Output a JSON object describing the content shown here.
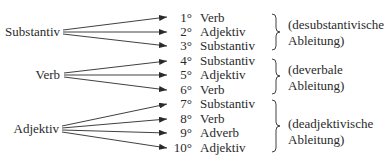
{
  "diagram": {
    "sources": [
      {
        "label": "Substantiv"
      },
      {
        "label": "Verb"
      },
      {
        "label": "Adjektiv"
      }
    ],
    "targets": [
      {
        "num": "1°",
        "label": "Verb"
      },
      {
        "num": "2°",
        "label": "Adjektiv"
      },
      {
        "num": "3°",
        "label": "Substantiv"
      },
      {
        "num": "4°",
        "label": "Substantiv"
      },
      {
        "num": "5°",
        "label": "Adjektiv"
      },
      {
        "num": "6°",
        "label": "Verb"
      },
      {
        "num": "7°",
        "label": "Substantiv"
      },
      {
        "num": "8°",
        "label": "Verb"
      },
      {
        "num": "9°",
        "label": "Adverb"
      },
      {
        "num": "10°",
        "label": "Adjektiv"
      }
    ],
    "groups": [
      {
        "line1": "(desubstantivische",
        "line2": "Ableitung)"
      },
      {
        "line1": "(deverbale",
        "line2": "Ableitung)"
      },
      {
        "line1": "(deadjektivische",
        "line2": "Ableitung)"
      }
    ]
  }
}
